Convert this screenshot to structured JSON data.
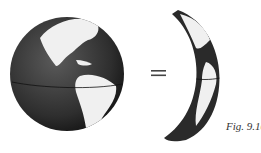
{
  "figure": {
    "caption": "Fig. 9.10",
    "left_object": "globe",
    "operator": "=",
    "right_object": "lune"
  },
  "colors": {
    "ocean": "#2a2a2a",
    "land": "#f2f2f2",
    "background": "#ffffff"
  }
}
